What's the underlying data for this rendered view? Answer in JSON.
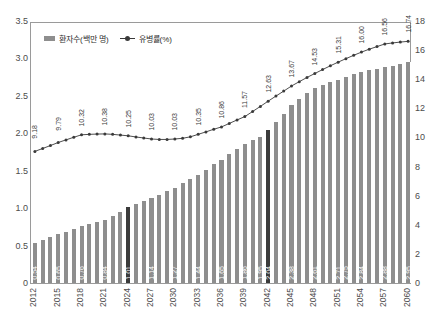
{
  "chart_data": {
    "type": "bar",
    "title": "",
    "xlabel": "",
    "ylabel": "",
    "grid": false,
    "legend_position": "top-left",
    "axes": {
      "left": {
        "label": "환자수(백만 명)",
        "ticks": [
          "0",
          "0.5",
          "1.0",
          "1.5",
          "2.0",
          "2.5",
          "3.0",
          "3.5"
        ],
        "min": 0,
        "max": 3.5
      },
      "right": {
        "label": "유병률(%)",
        "ticks": [
          "0",
          "2",
          "4",
          "6",
          "8",
          "10",
          "12",
          "14",
          "16",
          "18"
        ],
        "min": 0,
        "max": 18
      }
    },
    "categories": [
      "2012",
      "2013",
      "2014",
      "2015",
      "2016",
      "2017",
      "2018",
      "2019",
      "2020",
      "2021",
      "2022",
      "2023",
      "2024",
      "2025",
      "2026",
      "2027",
      "2028",
      "2029",
      "2030",
      "2031",
      "2032",
      "2033",
      "2034",
      "2035",
      "2036",
      "2037",
      "2038",
      "2039",
      "2040",
      "2041",
      "2042",
      "2043",
      "2044",
      "2045",
      "2046",
      "2047",
      "2048",
      "2049",
      "2050",
      "2051",
      "2052",
      "2053",
      "2054",
      "2055",
      "2056",
      "2057",
      "2058",
      "2059",
      "2060"
    ],
    "xtick_labels": [
      "2012",
      "2015",
      "2018",
      "2021",
      "2024",
      "2027",
      "2030",
      "2033",
      "2036",
      "2039",
      "2042",
      "2045",
      "2048",
      "2051",
      "2054",
      "2057",
      "2060"
    ],
    "series": [
      {
        "name": "환자수(백만 명)",
        "type": "bar",
        "axis": "left",
        "color": "#8e8e8e",
        "highlight_color": "#3b3b3b",
        "highlight_categories": [
          "2024",
          "2042"
        ],
        "values": [
          0.54,
          0.575,
          0.61,
          0.65,
          0.685,
          0.72,
          0.76,
          0.79,
          0.815,
          0.84,
          0.895,
          0.95,
          1.01,
          1.05,
          1.1,
          1.14,
          1.18,
          1.23,
          1.27,
          1.33,
          1.385,
          1.44,
          1.515,
          1.585,
          1.65,
          1.72,
          1.79,
          1.86,
          1.91,
          1.95,
          2.04,
          2.15,
          2.26,
          2.38,
          2.46,
          2.54,
          2.61,
          2.645,
          2.68,
          2.71,
          2.75,
          2.79,
          2.815,
          2.84,
          2.855,
          2.88,
          2.905,
          2.93,
          2.95
        ],
        "labels": {
          "2012": "0.54",
          "2015": "0.65",
          "2018": "0.76",
          "2021": "0.84",
          "2024": "1.01",
          "2027": "1.14",
          "2030": "1.27",
          "2033": "1.44",
          "2036": "1.65",
          "2039": "1.86",
          "2041": "1.95",
          "2042": "2.04",
          "2045": "2.38",
          "2048": "2.61",
          "2051": "2.71",
          "2052": "2.75",
          "2054": "2.84",
          "2057": "2.88",
          "2060": "2.95"
        }
      },
      {
        "name": "유병률(%)",
        "type": "line",
        "axis": "right",
        "color": "#3a3a3a",
        "values": [
          9.18,
          9.38,
          9.58,
          9.79,
          9.97,
          10.15,
          10.32,
          10.35,
          10.37,
          10.38,
          10.35,
          10.3,
          10.25,
          10.17,
          10.1,
          10.03,
          10.0,
          10.0,
          10.03,
          10.08,
          10.18,
          10.35,
          10.52,
          10.7,
          10.86,
          11.1,
          11.34,
          11.57,
          11.92,
          12.27,
          12.63,
          12.98,
          13.32,
          13.67,
          13.97,
          14.26,
          14.53,
          14.8,
          15.06,
          15.31,
          15.55,
          15.78,
          16.0,
          16.2,
          16.38,
          16.56,
          16.63,
          16.69,
          16.74
        ],
        "labels": {
          "2012": "9.18",
          "2015": "9.79",
          "2018": "10.32",
          "2021": "10.38",
          "2024": "10.25",
          "2027": "10.03",
          "2030": "10.03",
          "2033": "10.35",
          "2036": "10.86",
          "2039": "11.57",
          "2042": "12.63",
          "2045": "13.67",
          "2048": "14.53",
          "2051": "15.31",
          "2054": "16.00",
          "2057": "16.56",
          "2060": "16.74"
        }
      }
    ]
  }
}
